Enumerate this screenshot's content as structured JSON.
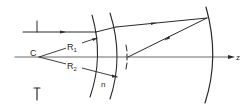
{
  "diagram": {
    "type": "optical-schematic",
    "labels": {
      "center": "C",
      "radius1": "R",
      "radius1_sub": "1",
      "radius2": "R",
      "radius2_sub": "2",
      "index": "n",
      "axis": "z"
    },
    "colors": {
      "line": "#2a2a2a",
      "background": "#ffffff"
    },
    "elements": [
      "incident-ray",
      "lens-front-surface",
      "lens-back-surface",
      "concave-mirror",
      "reflected-ray",
      "aperture-stop",
      "optical-axis",
      "center-of-curvature"
    ]
  }
}
